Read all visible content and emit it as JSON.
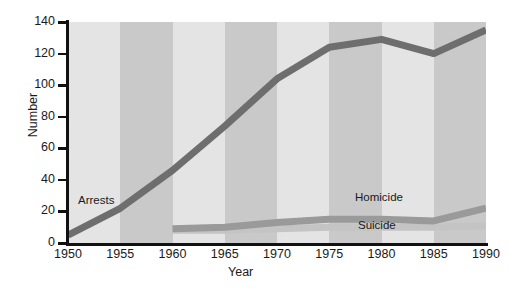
{
  "figure": {
    "background": "#ffffff",
    "plot_background": "#e9e9e9",
    "band_dark": "#c9c9c9",
    "band_light": "#e4e4e4"
  },
  "axes": {
    "ylabel": "Number",
    "xlabel": "Year",
    "y_ticks": [
      "140",
      "120",
      "100",
      "80",
      "60",
      "40",
      "20",
      "0"
    ],
    "x_ticks": [
      "1950",
      "1955",
      "1960",
      "1965",
      "1970",
      "1975",
      "1980",
      "1985",
      "1990"
    ]
  },
  "series_labels": {
    "arrests": "Arrests",
    "homicide": "Homicide",
    "suicide": "Suicide"
  },
  "chart_data": {
    "type": "line",
    "title": "",
    "subtitle": "",
    "xlabel": "Year",
    "ylabel": "Number",
    "x": [
      1950,
      1955,
      1960,
      1965,
      1970,
      1975,
      1980,
      1985,
      1990
    ],
    "xlim": [
      1950,
      1990
    ],
    "ylim": [
      0,
      140
    ],
    "yticks": [
      0,
      20,
      40,
      60,
      80,
      100,
      120,
      140
    ],
    "xticks": [
      1950,
      1955,
      1960,
      1965,
      1970,
      1975,
      1980,
      1985,
      1990
    ],
    "grid": false,
    "legend": "inline-labels",
    "series": [
      {
        "name": "Arrests",
        "color": "#6e6e6e",
        "linewidth": 7,
        "x": [
          1950,
          1955,
          1960,
          1965,
          1970,
          1975,
          1980,
          1985,
          1990
        ],
        "values": [
          5,
          22,
          46,
          74,
          104,
          124,
          129,
          120,
          135
        ]
      },
      {
        "name": "Homicide",
        "color": "#9a9a9a",
        "linewidth": 7,
        "x": [
          1960,
          1965,
          1970,
          1975,
          1980,
          1985,
          1990
        ],
        "values": [
          9,
          10,
          13,
          15,
          15,
          14,
          22
        ]
      },
      {
        "name": "Suicide",
        "color": "#c4c4c4",
        "linewidth": 7,
        "x": [
          1960,
          1965,
          1970,
          1975,
          1980,
          1985,
          1990
        ],
        "values": [
          8,
          8,
          9,
          10,
          10,
          10,
          11
        ]
      }
    ],
    "annotations": [
      {
        "text": "Arrests",
        "x": 1951,
        "y": 25
      },
      {
        "text": "Homicide",
        "x": 1978,
        "y": 27
      },
      {
        "text": "Suicide",
        "x": 1978,
        "y": 8
      }
    ],
    "background_bands": {
      "note": "alternating vertical light/medium gray stripes every 5 years",
      "edges": [
        1950,
        1955,
        1960,
        1965,
        1970,
        1975,
        1980,
        1985,
        1990
      ]
    }
  }
}
